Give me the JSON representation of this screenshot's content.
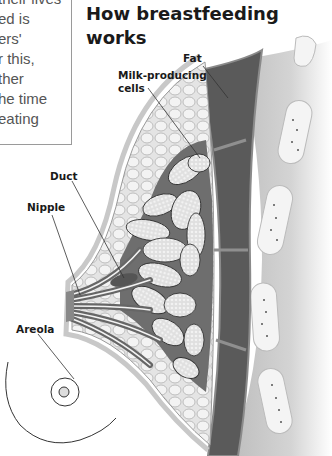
{
  "intro_text": {
    "lines": [
      "their lives",
      "ed is",
      "ers'",
      "r this,",
      "ther",
      "he time",
      "eating"
    ]
  },
  "title": {
    "line1": "How breastfeeding",
    "line2": "works"
  },
  "labels": {
    "fat": "Fat",
    "milk_cells_line1": "Milk-producing",
    "milk_cells_line2": "cells",
    "duct": "Duct",
    "nipple": "Nipple",
    "areola": "Areola"
  }
}
